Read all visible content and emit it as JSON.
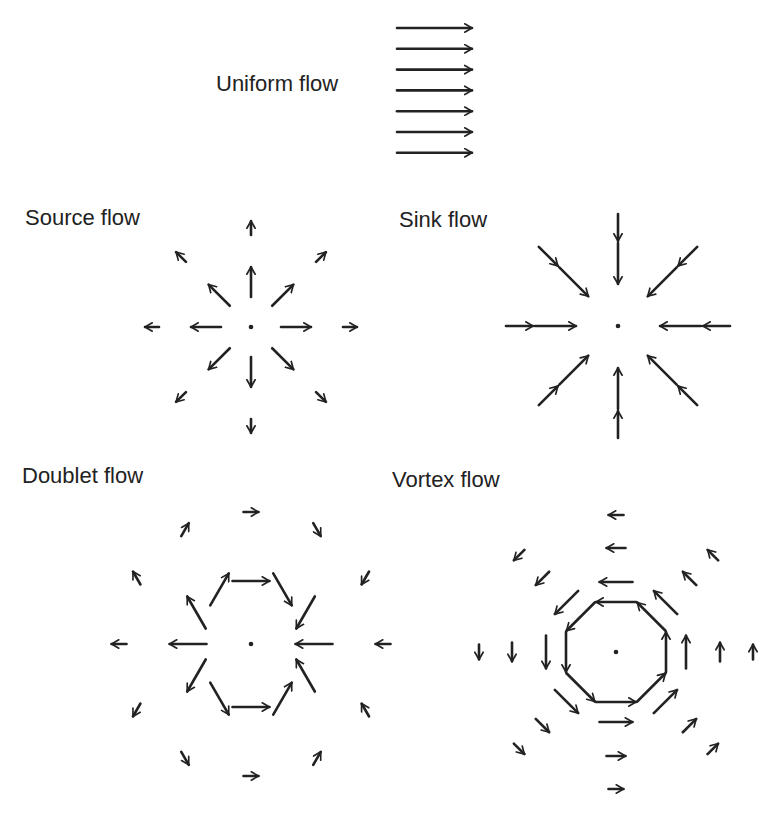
{
  "colors": {
    "ink": "#222222",
    "background": "#ffffff"
  },
  "panels": [
    {
      "id": "uniform",
      "title": "Uniform flow",
      "type": "uniform",
      "direction": "right",
      "arrow_count": 7
    },
    {
      "id": "source",
      "title": "Source flow",
      "type": "source",
      "directions_deg": [
        0,
        45,
        90,
        135,
        180,
        225,
        270,
        315
      ],
      "rings": [
        {
          "name": "inner",
          "relative_strength": 1.0
        },
        {
          "name": "outer",
          "relative_strength": 0.5
        }
      ]
    },
    {
      "id": "sink",
      "title": "Sink flow",
      "type": "sink",
      "directions_deg": [
        0,
        45,
        90,
        135,
        180,
        225,
        270,
        315
      ],
      "rings": [
        {
          "name": "inner",
          "relative_strength": 1.0
        },
        {
          "name": "outer",
          "relative_strength": 0.55
        }
      ]
    },
    {
      "id": "doublet",
      "title": "Doublet flow",
      "type": "doublet",
      "angles_deg": [
        0,
        30,
        60,
        90,
        120,
        150,
        180,
        210,
        240,
        270,
        300,
        330
      ],
      "rings": [
        {
          "name": "inner",
          "relative_strength": 1.0
        },
        {
          "name": "outer",
          "relative_strength": 0.4
        }
      ]
    },
    {
      "id": "vortex",
      "title": "Vortex flow",
      "type": "vortex",
      "rotation": "counterclockwise",
      "directions_deg": [
        0,
        45,
        90,
        135,
        180,
        225,
        270,
        315
      ],
      "rings": [
        {
          "name": "ring-1",
          "relative_strength": 1.0
        },
        {
          "name": "ring-2",
          "relative_strength": 0.8
        },
        {
          "name": "ring-3",
          "relative_strength": 0.5
        },
        {
          "name": "ring-4",
          "relative_strength": 0.4
        }
      ]
    }
  ]
}
